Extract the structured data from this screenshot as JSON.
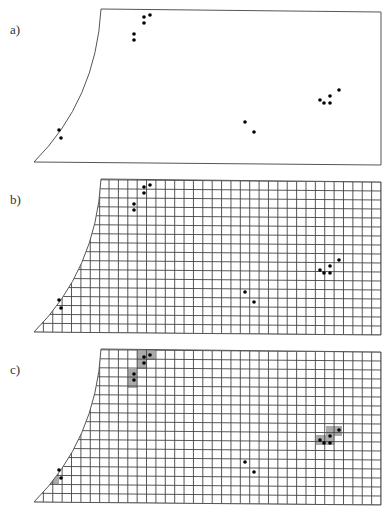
{
  "figure": {
    "panels": [
      {
        "label": "a)",
        "grid": false,
        "shaded": false
      },
      {
        "label": "b)",
        "grid": true,
        "shaded": false
      },
      {
        "label": "c)",
        "grid": true,
        "shaded": true
      }
    ],
    "region": {
      "top_left": [
        101,
        9
      ],
      "top_right": [
        381,
        12
      ],
      "bottom_right": [
        381,
        165
      ],
      "bottom_left": [
        34,
        162
      ],
      "curve_control": [
        96,
        100
      ]
    },
    "grid": {
      "cols": 37,
      "rows": 17
    },
    "points": [
      [
        144,
        17
      ],
      [
        150,
        15
      ],
      [
        144,
        23
      ],
      [
        134,
        34
      ],
      [
        134,
        40
      ],
      [
        59,
        130
      ],
      [
        61,
        138
      ],
      [
        245,
        122
      ],
      [
        254,
        132
      ],
      [
        320,
        100
      ],
      [
        324,
        103
      ],
      [
        330,
        96
      ],
      [
        330,
        103
      ],
      [
        339,
        90
      ]
    ],
    "shaded_cells": [
      [
        137,
        11,
        18,
        9
      ],
      [
        137,
        20,
        9,
        9
      ],
      [
        128,
        29,
        9,
        19
      ],
      [
        50,
        125,
        9,
        19
      ],
      [
        316,
        95,
        18,
        10
      ],
      [
        326,
        86,
        16,
        10
      ]
    ],
    "colors": {
      "outline": "#555555",
      "grid": "#444444",
      "dot": "#000000",
      "shade": "#aaaaaa"
    }
  }
}
